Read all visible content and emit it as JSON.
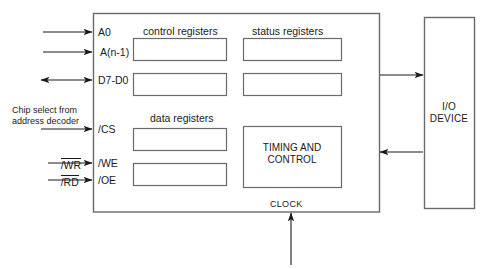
{
  "diagram": {
    "line_color": "#4a4a4a",
    "arrow_color": "#1a1a1a",
    "text_color": "#1a1a1a",
    "background": "#ffffff"
  },
  "chip": {
    "pins": [
      {
        "name": "pin-a0",
        "label": "A0",
        "signal_direction": "in"
      },
      {
        "name": "pin-an1",
        "label": "A(n-1)",
        "signal_direction": "in"
      },
      {
        "name": "pin-d7d0",
        "label": "D7-D0",
        "signal_direction": "bidirectional"
      },
      {
        "name": "pin-cs",
        "label": "/CS",
        "signal_direction": "in"
      },
      {
        "name": "pin-we",
        "label": "/WE",
        "signal_direction": "in"
      },
      {
        "name": "pin-oe",
        "label": "/OE",
        "signal_direction": "in"
      }
    ],
    "external_signals": [
      {
        "name": "chip-select-note",
        "line1": "Chip select from",
        "line2": "address decoder"
      },
      {
        "name": "wr-signal",
        "label": "/WR",
        "overline": true
      },
      {
        "name": "rd-signal",
        "label": "/RD",
        "overline": true
      }
    ],
    "groups": [
      {
        "name": "control-registers",
        "label": "control registers",
        "count": 2
      },
      {
        "name": "status-registers",
        "label": "status registers",
        "count": 2
      },
      {
        "name": "data-registers",
        "label": "data registers",
        "count": 2
      }
    ],
    "timing_block": {
      "line1": "TIMING AND",
      "line2": "CONTROL"
    },
    "clock": {
      "label": "CLOCK"
    }
  },
  "io_device": {
    "line1": "I/O",
    "line2": "DEVICE"
  }
}
